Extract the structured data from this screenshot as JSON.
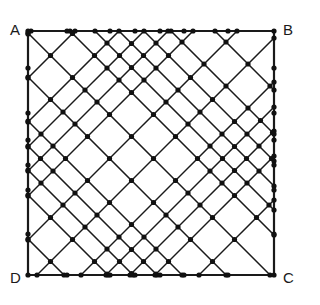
{
  "figure": {
    "type": "geometric-diagram",
    "background_color": "#ffffff",
    "stroke_color": "#1a1a1a",
    "vertex_dot_color": "#111111",
    "border_stroke_width": 2.2,
    "diagonal_stroke_width": 1.5,
    "dot_radius": 2.6,
    "square": {
      "left": 28,
      "top": 31,
      "right": 274,
      "bottom": 275,
      "width": 246,
      "height": 244
    },
    "corner_labels": [
      {
        "id": "A",
        "text": "A",
        "position": "top-left"
      },
      {
        "id": "B",
        "text": "B",
        "position": "top-right"
      },
      {
        "id": "C",
        "text": "C",
        "position": "bottom-right"
      },
      {
        "id": "D",
        "text": "D",
        "position": "bottom-left"
      }
    ],
    "edge_points": {
      "top_x": [
        28,
        67,
        110,
        135,
        160,
        184,
        228,
        274
      ],
      "bottom_x": [
        28,
        67,
        110,
        135,
        160,
        184,
        228,
        274
      ],
      "left_y": [
        31,
        68,
        113,
        140,
        165,
        190,
        234,
        275
      ],
      "right_y": [
        31,
        68,
        113,
        140,
        165,
        190,
        234,
        275
      ]
    },
    "chart_data": {
      "type": "scatter",
      "title": "Square ABCD with diagonal lattice",
      "xlabel": "",
      "ylabel": "",
      "grid": false,
      "legend": "none",
      "description": "A square ABCD overlaid with two families of parallel 45-degree diagonal lines forming a rhombus/diamond lattice. Dots mark line endpoints and intersections on and inside the square.",
      "vertices": [
        {
          "label": "A",
          "x": 28,
          "y": 31
        },
        {
          "label": "B",
          "x": 274,
          "y": 31
        },
        {
          "label": "C",
          "x": 274,
          "y": 275
        },
        {
          "label": "D",
          "x": 28,
          "y": 275
        }
      ],
      "diagonal_family_down_offsets": [
        -184,
        -140,
        -113,
        -88,
        -64,
        -39,
        5,
        49,
        93,
        118,
        142,
        167,
        211
      ],
      "diagonal_family_up_offsets": [
        62,
        106,
        150,
        175,
        199,
        224,
        268,
        312,
        356,
        381,
        405,
        430,
        474
      ]
    }
  }
}
